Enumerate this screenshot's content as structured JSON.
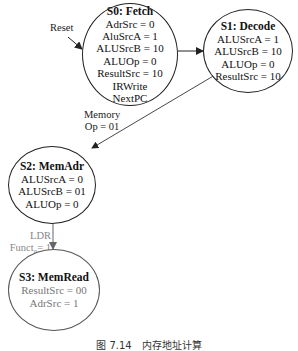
{
  "states": [
    {
      "id": "S0",
      "title": "S0: Fetch",
      "lines": [
        "AdrSrc = 0",
        "AluSrcA = 1",
        "ALUSrcB = 10",
        "ALUOp = 0",
        "ResultSrc = 10",
        "IRWrite",
        "NextPC"
      ]
    },
    {
      "id": "S1",
      "title": "S1: Decode",
      "lines": [
        "ALUSrcA = 1",
        "ALUSrcB = 10",
        "ALUOp = 0",
        "ResultSrc = 10"
      ]
    },
    {
      "id": "S2",
      "title": "S2: MemAdr",
      "lines": [
        "ALUSrcA = 0",
        "ALUSrcB = 01",
        "ALUOp = 0"
      ]
    },
    {
      "id": "S3",
      "title": "S3: MemRead",
      "lines": [
        "ResultSrc = 00",
        "AdrSrc = 1"
      ]
    }
  ],
  "transitions": [
    {
      "from": "Reset",
      "to": "S0",
      "label": "Reset"
    },
    {
      "from": "S0",
      "to": "S1",
      "label": ""
    },
    {
      "from": "S1",
      "to": "S2",
      "label_line1": "Memory",
      "label_line2": "Op = 01"
    },
    {
      "from": "S2",
      "to": "S3",
      "label_line1": "LDR",
      "label_line2_prefix": "Funct",
      "label_line2_sub": "0",
      "label_line2_suffix": "= 1"
    }
  ],
  "caption": "图 7.14　内存地址计算"
}
